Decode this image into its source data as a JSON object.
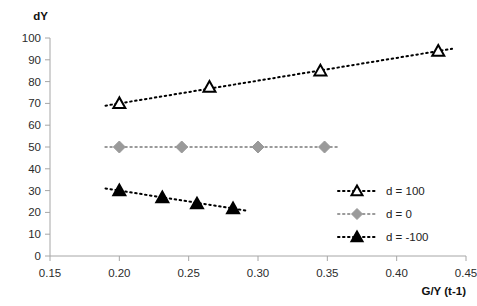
{
  "chart_data": {
    "type": "scatter",
    "title": "",
    "subtitle": "",
    "xlabel": "G/Y (t-1)",
    "ylabel": "dY",
    "xlim": [
      0.15,
      0.45
    ],
    "ylim": [
      0,
      100
    ],
    "xticks": [
      "0.15",
      "0.20",
      "0.25",
      "0.30",
      "0.35",
      "0.40",
      "0.45"
    ],
    "xtick_values": [
      0.15,
      0.2,
      0.25,
      0.3,
      0.35,
      0.4,
      0.45
    ],
    "yticks": [
      "0",
      "10",
      "20",
      "30",
      "40",
      "50",
      "60",
      "70",
      "80",
      "90",
      "100"
    ],
    "ytick_values": [
      0,
      10,
      20,
      30,
      40,
      50,
      60,
      70,
      80,
      90,
      100
    ],
    "grid": false,
    "legend_position": "center-right",
    "series": [
      {
        "name": "d = 100",
        "marker": "triangle-open",
        "color": "#000000",
        "line_style": "dotted",
        "x": [
          0.2,
          0.265,
          0.345,
          0.43
        ],
        "y": [
          70,
          77.5,
          85,
          94
        ]
      },
      {
        "name": "d = 0",
        "marker": "diamond-filled",
        "color": "#9a9a9a",
        "line_style": "dotted",
        "x": [
          0.2,
          0.245,
          0.3,
          0.348
        ],
        "y": [
          50,
          50,
          50,
          50
        ]
      },
      {
        "name": "d = -100",
        "marker": "triangle-filled",
        "color": "#000000",
        "line_style": "dotted",
        "x": [
          0.2,
          0.231,
          0.256,
          0.282
        ],
        "y": [
          30,
          26.8,
          24,
          21.8
        ]
      }
    ]
  },
  "axes": {
    "y_axis_title": "dY",
    "x_axis_title": "G/Y (t-1)"
  },
  "legend": {
    "entries": [
      {
        "label": "d = 100"
      },
      {
        "label": "d = 0"
      },
      {
        "label": "d = -100"
      }
    ]
  },
  "colors": {
    "axis": "#a6a6a6",
    "text": "#2b2b2b",
    "series_dark": "#000000",
    "series_gray": "#9a9a9a",
    "background": "#ffffff"
  }
}
